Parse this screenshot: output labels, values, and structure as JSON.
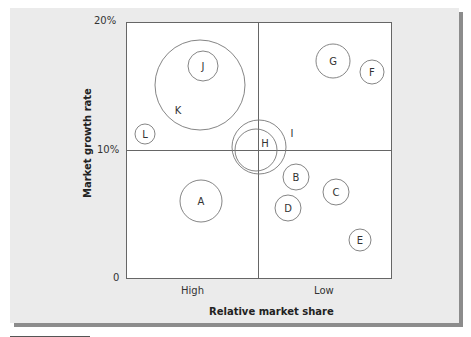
{
  "chart_data": {
    "type": "bubble-matrix",
    "title": "",
    "xlabel": "Relative market share",
    "ylabel": "Market growth rate",
    "x_tick_labels": [
      "High",
      "Low"
    ],
    "y_tick_labels": [
      "0",
      "10%",
      "20%"
    ],
    "ylim": [
      0,
      20
    ],
    "grid": "quadrant dividers at 10% growth and mid market share",
    "legend": null,
    "bubbles": [
      {
        "label": "A",
        "cx": 201,
        "cy": 201,
        "r": 21
      },
      {
        "label": "B",
        "cx": 296,
        "cy": 177,
        "r": 13
      },
      {
        "label": "C",
        "cx": 336,
        "cy": 192,
        "r": 13
      },
      {
        "label": "D",
        "cx": 288,
        "cy": 208,
        "r": 13
      },
      {
        "label": "E",
        "cx": 360,
        "cy": 240,
        "r": 11
      },
      {
        "label": "F",
        "cx": 372,
        "cy": 72,
        "r": 12
      },
      {
        "label": "G",
        "cx": 333,
        "cy": 61,
        "r": 17
      },
      {
        "label": "H",
        "cx": 256,
        "cy": 150,
        "r": 21,
        "label_x": 265,
        "label_y": 143
      },
      {
        "label": "I",
        "cx": 259,
        "cy": 147,
        "r": 27,
        "label_x": 292,
        "label_y": 133
      },
      {
        "label": "J",
        "cx": 203,
        "cy": 66,
        "r": 15
      },
      {
        "label": "K",
        "cx": 200,
        "cy": 85,
        "r": 45,
        "label_x": 178,
        "label_y": 110
      },
      {
        "label": "L",
        "cx": 145,
        "cy": 134,
        "r": 10
      }
    ]
  },
  "axes": {
    "y_top": "20%",
    "y_mid": "10%",
    "y_zero": "0",
    "x_left": "High",
    "x_right": "Low",
    "x_title": "Relative market share",
    "y_title": "Market growth rate"
  },
  "colors": {
    "panel": "#ebebeb",
    "plot_bg": "#ffffff",
    "line": "#666666",
    "bubble_stroke": "#777777",
    "shadow": "#8c8c8c"
  }
}
